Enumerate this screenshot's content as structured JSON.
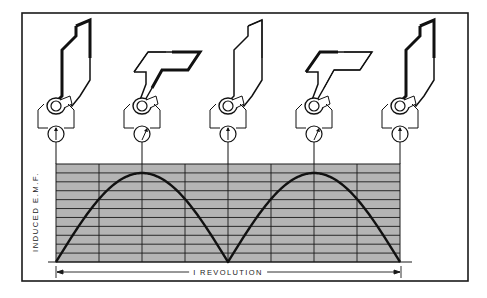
{
  "diagram": {
    "axis_label": "INDUCED E.M.F.",
    "span_label": "I REVOLUTION",
    "colors": {
      "grid_fill": "#b4b4b4",
      "ink": "#1a1a1a",
      "background": "#ffffff"
    },
    "grid": {
      "columns": 8,
      "rows": 11
    },
    "units": [
      {
        "position": 1,
        "angle_deg": 0,
        "meter": "zero"
      },
      {
        "position": 2,
        "angle_deg": 90,
        "meter": "maximum"
      },
      {
        "position": 3,
        "angle_deg": 180,
        "meter": "zero"
      },
      {
        "position": 4,
        "angle_deg": 270,
        "meter": "maximum"
      },
      {
        "position": 5,
        "angle_deg": 360,
        "meter": "zero"
      }
    ],
    "curve": {
      "type": "rectified sine (two positive half-waves)",
      "zero_points": [
        0,
        180,
        360
      ],
      "peaks": [
        90,
        270
      ]
    }
  }
}
